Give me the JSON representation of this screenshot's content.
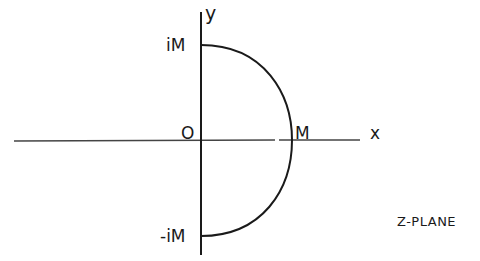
{
  "diagram": {
    "title": "Z-PLANE",
    "axes": {
      "x_label": "x",
      "y_label": "y",
      "origin_label": "O"
    },
    "points": {
      "top": "iM",
      "right": "M",
      "bottom": "-iM"
    },
    "shape": "semicircle contour of radius M in right half-plane",
    "colors": {
      "ink": "#1a1a1a",
      "background": "#ffffff"
    }
  }
}
